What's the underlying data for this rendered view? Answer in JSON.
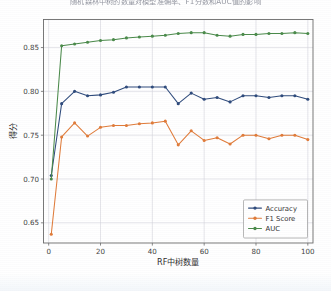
{
  "figure": {
    "title": "随机森林中树的数量对模型准确率、F1分数和AUC值的影响",
    "title_visible_note": "cropped at top edge"
  },
  "chart_data": {
    "type": "line",
    "title": "随机森林中树的数量对模型准确率、F1分数和AUC值的影响",
    "xlabel": "RF中树数量",
    "ylabel": "得分",
    "xlim": [
      -2,
      102
    ],
    "ylim": [
      0.627,
      0.882
    ],
    "xticks": [
      0,
      20,
      40,
      60,
      80,
      100
    ],
    "xtick_labels": [
      "0",
      "20",
      "40",
      "60",
      "80",
      "100"
    ],
    "yticks": [
      0.65,
      0.7,
      0.75,
      0.8,
      0.85
    ],
    "ytick_labels": [
      "0.65",
      "0.70",
      "0.75",
      "0.80",
      "0.85"
    ],
    "grid": true,
    "legend_position": "lower right",
    "x": [
      1,
      5,
      10,
      15,
      20,
      25,
      30,
      35,
      40,
      45,
      50,
      55,
      60,
      65,
      70,
      75,
      80,
      85,
      90,
      95,
      100
    ],
    "series": [
      {
        "name": "Accuracy",
        "color": "#2f4b7c",
        "marker": "o",
        "values": [
          0.704,
          0.786,
          0.8,
          0.795,
          0.796,
          0.799,
          0.805,
          0.805,
          0.805,
          0.805,
          0.786,
          0.798,
          0.791,
          0.793,
          0.788,
          0.795,
          0.795,
          0.793,
          0.795,
          0.795,
          0.791
        ]
      },
      {
        "name": "F1 Score",
        "color": "#e07b39",
        "marker": "o",
        "values": [
          0.637,
          0.748,
          0.764,
          0.749,
          0.759,
          0.761,
          0.761,
          0.763,
          0.764,
          0.766,
          0.739,
          0.755,
          0.744,
          0.747,
          0.74,
          0.75,
          0.75,
          0.746,
          0.75,
          0.75,
          0.745
        ]
      },
      {
        "name": "AUC",
        "color": "#4a8a4a",
        "marker": "o",
        "values": [
          0.7,
          0.852,
          0.854,
          0.856,
          0.858,
          0.859,
          0.861,
          0.862,
          0.863,
          0.864,
          0.866,
          0.867,
          0.867,
          0.864,
          0.863,
          0.865,
          0.865,
          0.866,
          0.866,
          0.867,
          0.866
        ]
      }
    ]
  },
  "legend": {
    "entries": [
      {
        "label": "Accuracy",
        "color": "#2f4b7c"
      },
      {
        "label": "F1 Score",
        "color": "#e07b39"
      },
      {
        "label": "AUC",
        "color": "#4a8a4a"
      }
    ]
  }
}
